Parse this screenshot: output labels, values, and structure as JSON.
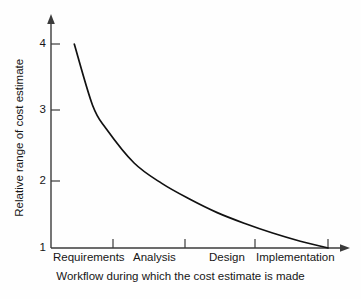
{
  "chart_data": {
    "type": "line",
    "title": "",
    "xlabel": "Workflow during which the cost estimate is made",
    "ylabel": "Relative range of cost estimate",
    "categories": [
      "Requirements",
      "Analysis",
      "Design",
      "Implementation"
    ],
    "yticks": [
      "1",
      "2",
      "3",
      "4"
    ],
    "ylim": [
      1,
      4
    ],
    "grid": false,
    "legend": null,
    "series": [
      {
        "name": "Relative range of cost estimate",
        "x": [
          0.42,
          0.75,
          1.0,
          1.5,
          2.0,
          2.5,
          3.0,
          3.5,
          4.0,
          4.5,
          5.0
        ],
        "values": [
          4.0,
          3.1,
          2.75,
          2.25,
          1.95,
          1.72,
          1.52,
          1.36,
          1.22,
          1.1,
          1.0
        ]
      }
    ],
    "axis_arrows": true,
    "curve_description": "Exponentially decaying curve falling from a relative range of 4 at the Requirements workflow to 1 at Implementation"
  },
  "axes": {
    "y_tick_values": [
      "4",
      "3",
      "2",
      "1"
    ],
    "x_tick_labels": [
      "Requirements",
      "Analysis",
      "Design",
      "Implementation"
    ],
    "y_title": "Relative range of cost estimate",
    "x_title": "Workflow during which the cost estimate is made"
  },
  "colors": {
    "background": "#fefefe",
    "axis": "#3b3b3b",
    "curve": "#111111",
    "text": "#161616"
  }
}
